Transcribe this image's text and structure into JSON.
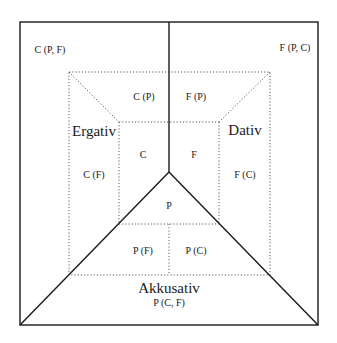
{
  "diagram": {
    "case_labels": {
      "ergativ": "Ergativ",
      "dativ": "Dativ",
      "akkusativ": "Akkusativ"
    },
    "corner_labels": {
      "top_left": "C (P, F)",
      "top_right": "F (P, C)",
      "bottom": "P (C, F)"
    },
    "region_labels": {
      "c_p": "C (P)",
      "f_p": "F (P)",
      "c": "C",
      "f": "F",
      "c_f": "C (F)",
      "f_c": "F (C)",
      "p": "P",
      "p_f": "P (F)",
      "p_c": "P (C)"
    },
    "colors": {
      "line": "#1a1a1a",
      "background": "#ffffff"
    }
  }
}
